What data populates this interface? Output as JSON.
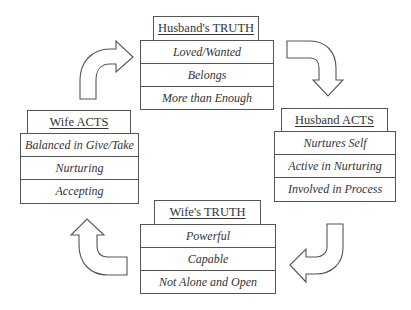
{
  "diagram": {
    "type": "cycle",
    "nodes": [
      {
        "id": "husbands-truth",
        "title": "Husband's TRUTH",
        "items": [
          "Loved/Wanted",
          "Belongs",
          "More than Enough"
        ]
      },
      {
        "id": "husband-acts",
        "title": "Husband ACTS",
        "items": [
          "Nurtures Self",
          "Active in Nurturing",
          "Involved in Process"
        ]
      },
      {
        "id": "wifes-truth",
        "title": "Wife's TRUTH",
        "items": [
          "Powerful",
          "Capable",
          "Not Alone and Open"
        ]
      },
      {
        "id": "wife-acts",
        "title": "Wife ACTS",
        "items": [
          "Balanced in Give/Take",
          "Nurturing",
          "Accepting"
        ]
      }
    ],
    "edges": [
      {
        "from": "wife-acts",
        "to": "husbands-truth",
        "icon": "curved-arrow-up-right-icon"
      },
      {
        "from": "husbands-truth",
        "to": "husband-acts",
        "icon": "curved-arrow-right-down-icon"
      },
      {
        "from": "husband-acts",
        "to": "wifes-truth",
        "icon": "curved-arrow-down-left-icon"
      },
      {
        "from": "wifes-truth",
        "to": "wife-acts",
        "icon": "curved-arrow-left-up-icon"
      }
    ],
    "colors": {
      "stroke": "#555555",
      "fill": "#ffffff",
      "text": "#333333"
    }
  }
}
